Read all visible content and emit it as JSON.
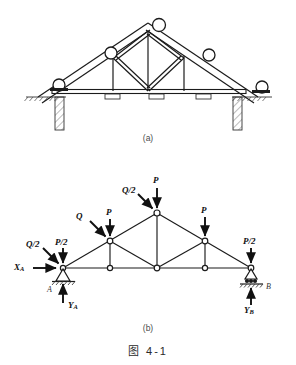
{
  "figure": {
    "caption": "图 4-1",
    "header_text": "",
    "panel_a_label": "(a)",
    "panel_b_label": "(b)"
  },
  "panel_a": {
    "title": "roof-truss-pictorial",
    "description": "Pictorial roof truss resting on two masonry walls, with purlin circles on the rafters and small bearing blocks on the bottom chord.",
    "purlins": [
      {
        "name": "purlin-left-eave"
      },
      {
        "name": "purlin-left-mid"
      },
      {
        "name": "purlin-apex"
      },
      {
        "name": "purlin-right-mid"
      },
      {
        "name": "purlin-right-eave"
      }
    ],
    "bearing_blocks": 3,
    "supports": [
      "masonry-wall-left",
      "masonry-wall-right"
    ]
  },
  "panel_b": {
    "title": "truss-free-body-diagram",
    "loads": [
      {
        "name": "load-Q-half-left",
        "label": "Q/2",
        "target_node": "A",
        "direction": "down-right-inclined"
      },
      {
        "name": "load-P-half-left",
        "label": "P/2",
        "target_node": "A",
        "direction": "down"
      },
      {
        "name": "load-Q-left",
        "label": "Q",
        "target_node": "upper-left",
        "direction": "down-right-inclined"
      },
      {
        "name": "load-P-left",
        "label": "P",
        "target_node": "upper-left",
        "direction": "down"
      },
      {
        "name": "load-Q-half-apex",
        "label": "Q/2",
        "target_node": "apex",
        "direction": "down-right-inclined"
      },
      {
        "name": "load-P-apex",
        "label": "P",
        "target_node": "apex",
        "direction": "down"
      },
      {
        "name": "load-P-right",
        "label": "P",
        "target_node": "upper-right",
        "direction": "down"
      },
      {
        "name": "load-P-half-right",
        "label": "P/2",
        "target_node": "B",
        "direction": "down"
      }
    ],
    "reactions": [
      {
        "name": "reaction-XA",
        "symbol": "X",
        "subscript": "A",
        "direction": "right"
      },
      {
        "name": "reaction-YA",
        "symbol": "Y",
        "subscript": "A",
        "direction": "up"
      },
      {
        "name": "reaction-YB",
        "symbol": "Y",
        "subscript": "B",
        "direction": "up"
      }
    ],
    "joints": [
      {
        "name": "joint-A",
        "label": "A"
      },
      {
        "name": "joint-B",
        "label": "B"
      }
    ],
    "support_types": {
      "left": "pin-support",
      "right": "roller-support"
    },
    "geometry": {
      "bottom_chord_nodes": 5,
      "upper_nodes": 3,
      "span_note": "symmetric triangular truss with vertical and diagonal web members"
    }
  },
  "colors": {
    "ink": "#111111",
    "line": "#1b1b1b",
    "muted": "#4a4a4a",
    "page": "#ffffff"
  }
}
